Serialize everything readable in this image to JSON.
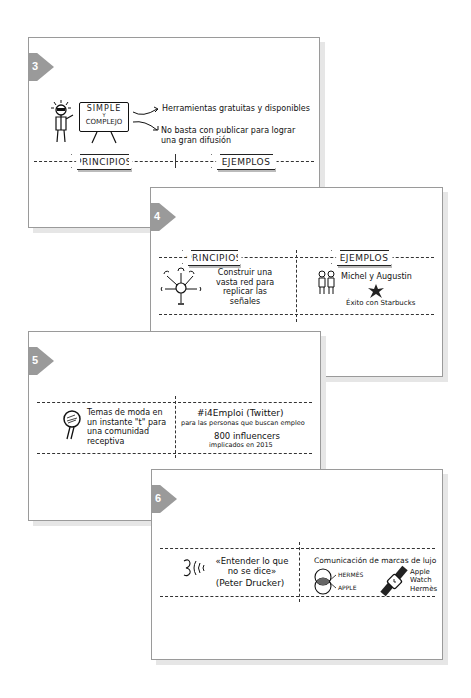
{
  "cards": [
    {
      "number": "3",
      "board": {
        "line1": "SIMPLE",
        "line2": "Y",
        "line3": "COMPLEJO"
      },
      "points": [
        "Herramientas gratuitas y disponibles",
        "No basta con publicar para lograr una gran difusión"
      ],
      "banner_left": "PRINCIPIOS",
      "banner_right": "EJEMPLOS"
    },
    {
      "number": "4",
      "banner_left": "PRINCIPIOS",
      "banner_right": "EJEMPLOS",
      "left_text": "Construir una vasta red para replicar las señales",
      "right_line1": "Michel y Augustin",
      "right_line2": "Éxito con Starbucks"
    },
    {
      "number": "5",
      "left_text": "Temas de moda en un instante \"t\" para una comunidad receptiva",
      "right_title": "#i4Emploi (Twitter)",
      "right_sub": "para las personas que buscan empleo",
      "right_count": "800 influencers",
      "right_note": "implicados en 2015"
    },
    {
      "number": "6",
      "quote": "«Entender lo que no se dice»",
      "author": "(Peter Drucker)",
      "right_title": "Comunicación de marcas de lujo",
      "venn_labels": [
        "HERMÈS",
        "APPLE"
      ],
      "watch_label": "Apple Watch Hermès"
    }
  ],
  "colors": {
    "badge": "#9a9a9a",
    "border": "#9a9a9a",
    "shadow": "#e6e6e6",
    "ink": "#1a1a1a"
  }
}
